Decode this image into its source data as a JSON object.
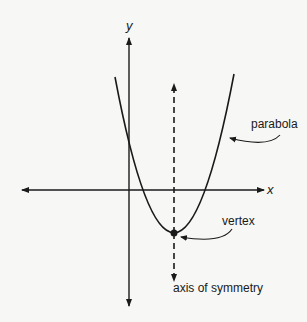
{
  "diagram": {
    "type": "parabola-diagram",
    "axes": {
      "x_label": "x",
      "y_label": "y"
    },
    "labels": {
      "parabola": "parabola",
      "vertex": "vertex",
      "axis_of_symmetry": "axis of symmetry"
    },
    "colors": {
      "background": "#f7f7f5",
      "ink": "#1a1a1a"
    }
  }
}
